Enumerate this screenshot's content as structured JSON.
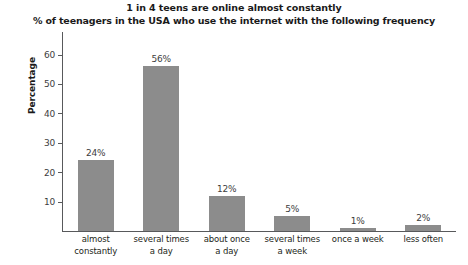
{
  "chart_data": {
    "type": "bar",
    "title": "1 in 4 teens are online almost constantly",
    "subtitle": "% of teenagers in the USA who use the internet with the following frequency",
    "xlabel": "",
    "ylabel": "Percentage",
    "ylim": [
      0,
      68
    ],
    "yticks": [
      10,
      20,
      30,
      40,
      50,
      60
    ],
    "ytick_labels": [
      "10",
      "20",
      "30",
      "40",
      "50",
      "60"
    ],
    "grid": false,
    "legend": "none",
    "bar_color": "#8c8c8c",
    "axis_color": "#58595b",
    "categories": [
      "almost constantly",
      "several times a day",
      "about once a day",
      "several times a week",
      "once a week",
      "less often"
    ],
    "category_lines": [
      [
        "almost",
        "constantly"
      ],
      [
        "several times",
        "a day"
      ],
      [
        "about once",
        "a day"
      ],
      [
        "several times",
        "a week"
      ],
      [
        "once a week",
        ""
      ],
      [
        "less often",
        ""
      ]
    ],
    "values": [
      24,
      56,
      12,
      5,
      1,
      2
    ],
    "value_labels": [
      "24%",
      "56%",
      "12%",
      "5%",
      "1%",
      "2%"
    ]
  }
}
